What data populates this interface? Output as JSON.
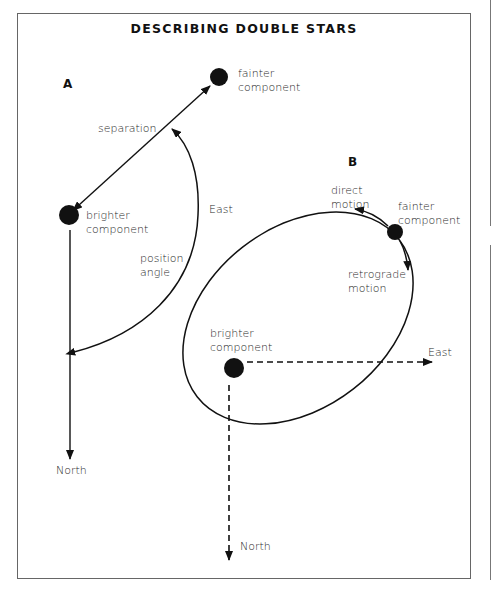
{
  "title": "DESCRIBING DOUBLE STARS",
  "diagram_a": {
    "label": "A",
    "fainter": [
      "fainter",
      "component"
    ],
    "brighter": [
      "brighter",
      "component"
    ],
    "separation": "separation",
    "position_angle": [
      "position",
      "angle"
    ],
    "east": "East",
    "north": "North"
  },
  "diagram_b": {
    "label": "B",
    "fainter": [
      "fainter",
      "component"
    ],
    "brighter": [
      "brighter",
      "component"
    ],
    "direct_motion": [
      "direct",
      "motion"
    ],
    "retrograde_motion": [
      "retrograde",
      "motion"
    ],
    "east": "East",
    "north": "North"
  },
  "colors": {
    "ink": "#111111",
    "frame": "#666666",
    "background": "#ffffff"
  }
}
